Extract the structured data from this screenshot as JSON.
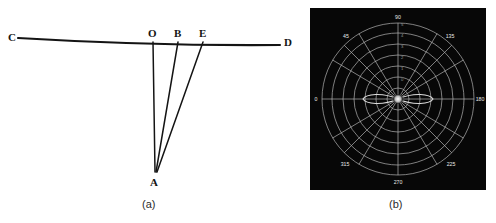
{
  "figure": {
    "panel_a": {
      "caption": "(a)",
      "type": "geometric-ray-diagram",
      "points": [
        {
          "label": "C",
          "x": 18,
          "y": 38,
          "label_x": 8,
          "label_y": 31
        },
        {
          "label": "O",
          "x": 153,
          "y": 43,
          "label_x": 148,
          "label_y": 27
        },
        {
          "label": "B",
          "x": 178,
          "y": 43,
          "label_x": 174,
          "label_y": 27
        },
        {
          "label": "E",
          "x": 203,
          "y": 43,
          "label_x": 199,
          "label_y": 27
        },
        {
          "label": "D",
          "x": 280,
          "y": 45,
          "label_x": 284,
          "label_y": 36
        },
        {
          "label": "A",
          "x": 155,
          "y": 172,
          "label_x": 150,
          "label_y": 176
        }
      ],
      "baseline": {
        "from": "C",
        "to": "D",
        "bowed": true
      },
      "rays": [
        {
          "from": "O",
          "to": "A"
        },
        {
          "from": "B",
          "to": "A"
        },
        {
          "from": "E",
          "to": "A"
        }
      ],
      "line_color": "#141414",
      "label_color": "#141414"
    },
    "panel_b": {
      "caption": "(b)",
      "type": "polar-radiation-pattern",
      "background_color": "#070707",
      "grid_color": "#c8c8c8",
      "label_color": "#e6e6e6",
      "angle_labels": [
        "0",
        "45",
        "90",
        "135",
        "180",
        "225",
        "270",
        "315"
      ],
      "angle_values": [
        0,
        45,
        90,
        135,
        180,
        225,
        270,
        315
      ],
      "radial_rings": 7,
      "radial_tick_labels": [
        "5",
        "4",
        "3",
        "2",
        "1",
        "0"
      ],
      "lobes": [
        {
          "side": "left",
          "description": "small side lobe left of center"
        },
        {
          "side": "right",
          "description": "small side lobe right of center"
        }
      ],
      "center_marker": "bright-center-spot"
    }
  }
}
